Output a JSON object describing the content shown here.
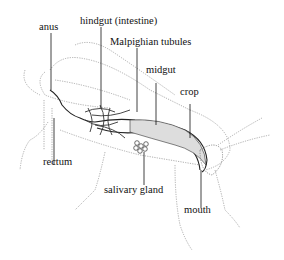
{
  "diagram": {
    "labels": {
      "anus": "anus",
      "hindgut": "hindgut (intestine)",
      "malpighian": "Malpighian tubules",
      "midgut": "midgut",
      "crop": "crop",
      "rectum": "rectum",
      "salivary": "salivary gland",
      "mouth": "mouth"
    }
  }
}
